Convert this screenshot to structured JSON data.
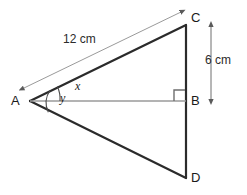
{
  "figure": {
    "background_color": "#ffffff",
    "stroke_color": "#2b2b2b",
    "thin_stroke_color": "#8d8d8d",
    "text_color": "#1a1a1a"
  },
  "vertices": [
    {
      "name": "A",
      "label": "A",
      "x": 30,
      "y": 101
    },
    {
      "name": "B",
      "label": "B",
      "x": 186,
      "y": 101
    },
    {
      "name": "C",
      "label": "C",
      "x": 186,
      "y": 25
    },
    {
      "name": "D",
      "label": "D",
      "x": 186,
      "y": 178
    }
  ],
  "segments": [
    {
      "name": "side-ac",
      "from": "A",
      "to": "C",
      "style": "thick"
    },
    {
      "name": "side-ad",
      "from": "A",
      "to": "D",
      "style": "thick"
    },
    {
      "name": "side-cd",
      "from": "C",
      "to": "D",
      "style": "thick"
    },
    {
      "name": "altitude-ab",
      "from": "A",
      "to": "B",
      "style": "thin"
    }
  ],
  "dimensions": [
    {
      "name": "dimension-ac",
      "label": "12 cm",
      "measures": "AC",
      "orientation": "parallel-to-ac",
      "arrows": "both"
    },
    {
      "name": "dimension-cb",
      "label": "6 cm",
      "measures": "CB",
      "orientation": "vertical",
      "arrows": "both"
    }
  ],
  "angles": [
    {
      "name": "angle-x",
      "label": "x",
      "vertex": "A",
      "between": [
        "AB",
        "AC"
      ],
      "arc_radius": 30
    },
    {
      "name": "angle-y",
      "label": "y",
      "vertex": "A",
      "between": [
        "AC",
        "AD"
      ],
      "arc_radius": 22
    }
  ],
  "markers": [
    {
      "name": "right-angle-marker",
      "label": "right angle",
      "at_vertex": "B",
      "between": [
        "BA",
        "BC"
      ],
      "size": 11
    }
  ]
}
